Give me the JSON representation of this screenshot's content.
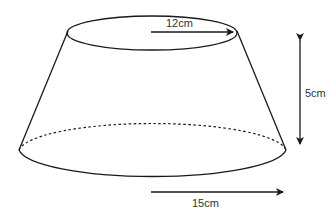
{
  "diagram": {
    "type": "frustum",
    "labels": {
      "top": "12cm",
      "height": "5cm",
      "bottom": "15cm"
    },
    "colors": {
      "stroke": "#1a1a1a",
      "text": "#333333",
      "background": "#ffffff"
    }
  }
}
